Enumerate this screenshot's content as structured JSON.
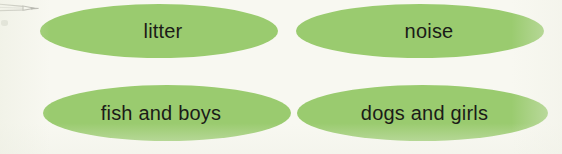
{
  "canvas": {
    "width": 562,
    "height": 154,
    "background_color": "#f8f8f1"
  },
  "palette": {
    "ellipse_fill": "#9acb6f",
    "label_color": "#1b1b18",
    "pencil_color": "#9a9a93"
  },
  "annotation": {
    "pencil_icon_name": "pencil-pointer-icon",
    "smudge_name": "paper-smudge"
  },
  "diagram": {
    "type": "word-bank",
    "rows": 2,
    "columns": 2,
    "shape": "ellipse",
    "nodes": [
      {
        "id": "litter",
        "label": "litter",
        "row": 1,
        "column": 1
      },
      {
        "id": "noise",
        "label": "noise",
        "row": 1,
        "column": 2
      },
      {
        "id": "fish-and-boys",
        "label": "fish and boys",
        "row": 2,
        "column": 1
      },
      {
        "id": "dogs-and-girls",
        "label": "dogs and girls",
        "row": 2,
        "column": 2
      }
    ]
  }
}
